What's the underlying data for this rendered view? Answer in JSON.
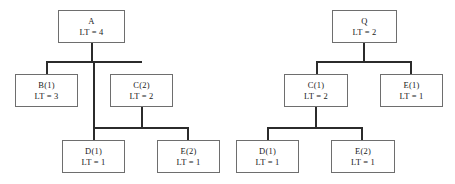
{
  "figure": {
    "type": "diagram",
    "subtype": "tree",
    "background_color": "#ffffff",
    "box_border_color": "#6e6e6e",
    "edge_color": "#2b2b2b",
    "text_color": "#1a1a1a"
  },
  "trees": [
    {
      "id": "left-tree",
      "root_label": "A",
      "nodes": [
        {
          "id": "a",
          "name": "A",
          "lt": "LT = 4",
          "lt_value": 4,
          "level": 0,
          "x": 58,
          "y": 10,
          "w": 67,
          "h": 33
        },
        {
          "id": "b1",
          "name": "B(1)",
          "lt": "LT = 3",
          "lt_value": 3,
          "level": 1,
          "x": 15,
          "y": 74,
          "w": 63,
          "h": 33
        },
        {
          "id": "c2",
          "name": "C(2)",
          "lt": "LT = 2",
          "lt_value": 2,
          "level": 1,
          "x": 110,
          "y": 74,
          "w": 63,
          "h": 33
        },
        {
          "id": "d1",
          "name": "D(1)",
          "lt": "LT = 1",
          "lt_value": 1,
          "level": 2,
          "x": 62,
          "y": 140,
          "w": 63,
          "h": 33
        },
        {
          "id": "e2",
          "name": "E(2)",
          "lt": "LT = 1",
          "lt_value": 1,
          "level": 2,
          "x": 157,
          "y": 140,
          "w": 63,
          "h": 33
        }
      ],
      "edges": [
        {
          "parent": "a",
          "children": [
            "b1",
            "d1"
          ],
          "stem_x": 92,
          "stem_top": 43,
          "bar_y": 61,
          "bar_left": 46,
          "bar_right": 142
        },
        {
          "parent": "c2",
          "children": [
            "d1",
            "e2"
          ],
          "stem_x": 142,
          "stem_top": 107,
          "bar_y": 127,
          "bar_left": 93,
          "bar_right": 189
        }
      ]
    },
    {
      "id": "right-tree",
      "root_label": "Q",
      "nodes": [
        {
          "id": "q",
          "name": "Q",
          "lt": "LT = 2",
          "lt_value": 2,
          "level": 0,
          "x": 332,
          "y": 10,
          "w": 65,
          "h": 33
        },
        {
          "id": "c1",
          "name": "C(1)",
          "lt": "LT = 2",
          "lt_value": 2,
          "level": 1,
          "x": 284,
          "y": 74,
          "w": 64,
          "h": 33
        },
        {
          "id": "e1",
          "name": "E(1)",
          "lt": "LT = 1",
          "lt_value": 1,
          "level": 1,
          "x": 380,
          "y": 74,
          "w": 63,
          "h": 33
        },
        {
          "id": "d1r",
          "name": "D(1)",
          "lt": "LT = 1",
          "lt_value": 1,
          "level": 2,
          "x": 236,
          "y": 140,
          "w": 63,
          "h": 33
        },
        {
          "id": "e2r",
          "name": "E(2)",
          "lt": "LT = 1",
          "lt_value": 1,
          "level": 2,
          "x": 331,
          "y": 140,
          "w": 64,
          "h": 33
        }
      ],
      "edges": [
        {
          "parent": "q",
          "children": [
            "c1",
            "e1"
          ],
          "stem_x": 364,
          "stem_top": 43,
          "bar_y": 61,
          "bar_left": 316,
          "bar_right": 412
        },
        {
          "parent": "c1",
          "children": [
            "d1r",
            "e2r"
          ],
          "stem_x": 316,
          "stem_top": 107,
          "bar_y": 127,
          "bar_left": 267,
          "bar_right": 363
        }
      ]
    }
  ]
}
